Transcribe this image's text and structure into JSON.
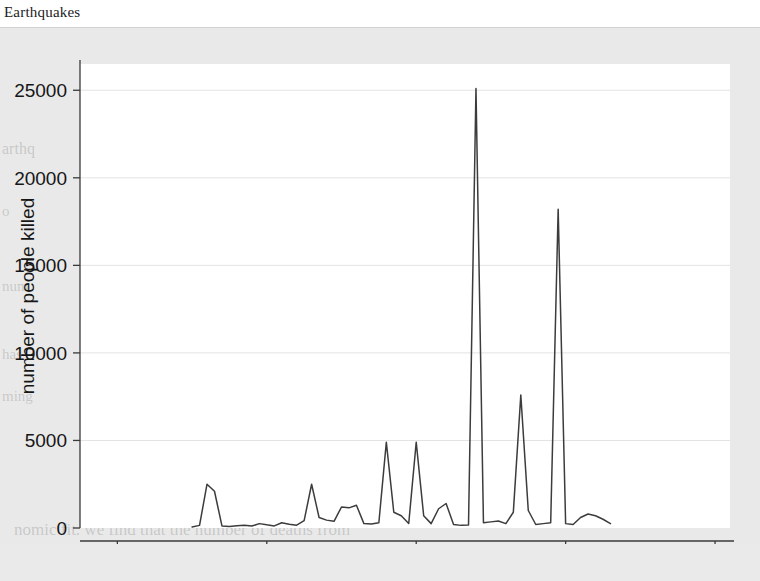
{
  "caption": "Earthquakes",
  "chart_data": {
    "type": "line",
    "title": "Earthquakes",
    "xlabel": "year",
    "ylabel": "number of people killed",
    "xlim": [
      1935,
      2022
    ],
    "ylim": [
      0,
      26500
    ],
    "xticks": [
      1940,
      1960,
      1980,
      2000,
      2020
    ],
    "yticks": [
      0,
      5000,
      10000,
      15000,
      20000,
      25000
    ],
    "xtick_labels": [
      "1940",
      "1960",
      "1980",
      "2000",
      "2020"
    ],
    "ytick_labels": [
      "0",
      "5000",
      "10000",
      "15000",
      "20000",
      "25000"
    ],
    "grid": "horizontal-faint",
    "legend": "none",
    "line_color": "#3c3c3c",
    "series": [
      {
        "name": "number of people killed",
        "x": [
          1950,
          1951,
          1952,
          1953,
          1954,
          1955,
          1956,
          1957,
          1958,
          1959,
          1960,
          1961,
          1962,
          1963,
          1964,
          1965,
          1966,
          1967,
          1968,
          1969,
          1970,
          1971,
          1972,
          1973,
          1974,
          1975,
          1976,
          1977,
          1978,
          1979,
          1980,
          1981,
          1982,
          1983,
          1984,
          1985,
          1986,
          1987,
          1988,
          1989,
          1990,
          1991,
          1992,
          1993,
          1994,
          1995,
          1996,
          1997,
          1998,
          1999,
          2000,
          2001,
          2002,
          2003,
          2004,
          2005,
          2006
        ],
        "values": [
          60,
          150,
          2500,
          2100,
          120,
          90,
          130,
          160,
          110,
          250,
          180,
          120,
          300,
          220,
          160,
          420,
          2500,
          600,
          450,
          380,
          1200,
          1150,
          1300,
          250,
          230,
          300,
          4900,
          900,
          700,
          260,
          4900,
          700,
          250,
          1100,
          1400,
          200,
          150,
          170,
          25100,
          300,
          350,
          400,
          250,
          900,
          7600,
          1000,
          200,
          250,
          300,
          18200,
          250,
          200,
          600,
          800,
          700,
          500,
          250
        ]
      }
    ]
  },
  "bleed_lines": [
    {
      "text": "arthq",
      "x": 2,
      "y": 112,
      "size": 16
    },
    {
      "text": "o",
      "x": 2,
      "y": 175,
      "size": 15
    },
    {
      "text": "num",
      "x": 2,
      "y": 250,
      "size": 15
    },
    {
      "text": "has",
      "x": 2,
      "y": 318,
      "size": 15
    },
    {
      "text": "ming",
      "x": 2,
      "y": 360,
      "size": 15
    },
    {
      "text": "nomic fit. we find that the number of deaths from",
      "x": 14,
      "y": 492,
      "size": 17
    },
    {
      "text": "n between deaths (1000) and plotting vegetation",
      "x": 10,
      "y": 532,
      "size": 17
    }
  ]
}
